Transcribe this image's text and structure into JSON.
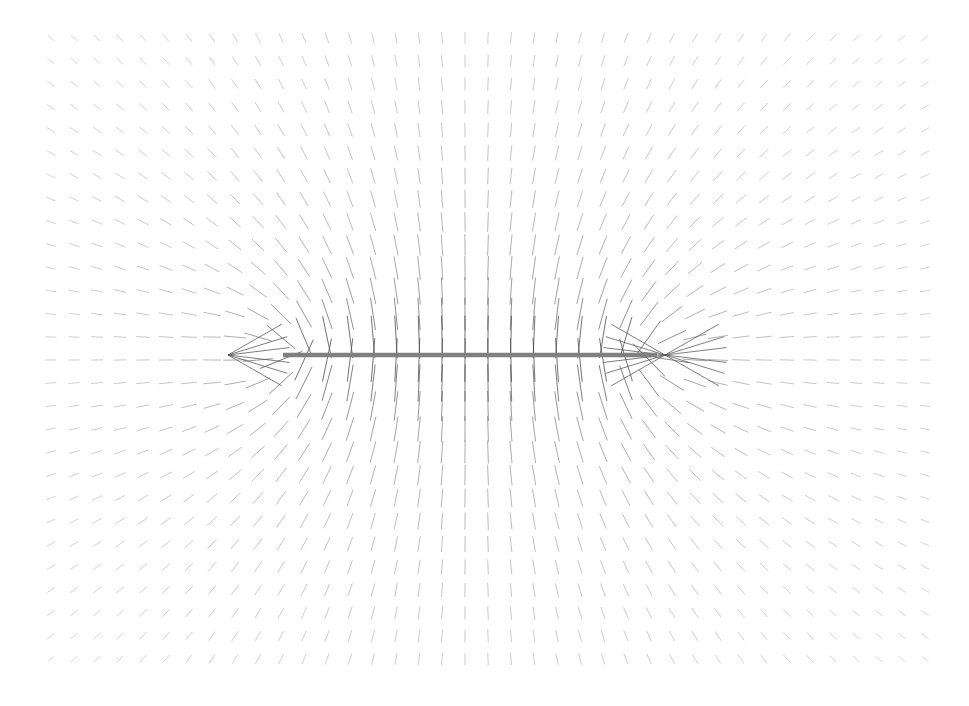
{
  "figure": {
    "title": "",
    "background_color": "#ffffff",
    "width": 969,
    "height": 706
  },
  "chart_data": {
    "type": "quiver",
    "title": "",
    "subtitle": "",
    "xlabel": "",
    "ylabel": "",
    "grid": false,
    "legend": false,
    "axes_visible": false,
    "tick_labels_x": [],
    "tick_labels_y": [],
    "xlim": [
      0,
      969
    ],
    "ylim": [
      706,
      0
    ],
    "grid_spec": {
      "x_start": 51,
      "y_start": 38,
      "spacing_x": 23.0,
      "spacing_y": 23.0,
      "n_cols": 39,
      "n_rows": 28
    },
    "glyph": {
      "style": "line-segment",
      "color": "#555555",
      "line_width": 0.9,
      "max_length_px": 46,
      "min_length_px": 1.5,
      "arrowheads": false
    },
    "sources": [
      {
        "name": "left-endpoint-charge",
        "kind": "point-sink",
        "x": 283,
        "y": 355,
        "strength": -1.0
      },
      {
        "name": "right-endpoint-charge",
        "kind": "point-source",
        "x": 657,
        "y": 355,
        "strength": 1.0
      }
    ],
    "node_points": [
      {
        "name": "left-convergence-node",
        "x": 228,
        "y": 355
      }
    ],
    "overlay_bar": {
      "name": "charged-rod",
      "x1": 283,
      "y1": 355,
      "x2": 657,
      "y2": 355,
      "thickness_px": 4.5,
      "color": "#808080",
      "cap": "butt"
    },
    "field_model": {
      "form": "finite-line-charge",
      "line_x_start": 283,
      "line_x_end": 657,
      "line_y": 355,
      "scale": 1400,
      "softening": 9
    },
    "annotations": []
  },
  "accessibility": {
    "region_label": "vector-field-plot"
  }
}
